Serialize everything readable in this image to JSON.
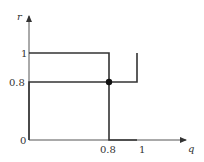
{
  "diagram": {
    "type": "best-response correspondence plot",
    "axes": {
      "x_label": "q",
      "y_label": "r",
      "x_ticks": [
        "0.8",
        "1"
      ],
      "y_ticks": [
        "1",
        "0.8"
      ],
      "origin_label": "0"
    },
    "curves": [
      {
        "name": "curve-1",
        "description": "r=1 for q<0.8, vertical at q=0.8 from 1 to 0, r=0 for q in 0.8..1",
        "points": [
          [
            0,
            1
          ],
          [
            0.8,
            1
          ],
          [
            0.8,
            0
          ],
          [
            1,
            0
          ]
        ]
      },
      {
        "name": "curve-2",
        "description": "q=0 for r<0.8, horizontal at r=0.8 from q=0 to 1, vertical at q=1 above 0.8",
        "points": [
          [
            0,
            0
          ],
          [
            0,
            0.8
          ],
          [
            1,
            0.8
          ],
          [
            1,
            1
          ]
        ]
      }
    ],
    "intersection": {
      "q": 0.8,
      "r": 0.8,
      "label": ""
    },
    "colors": {
      "line": "#333333",
      "axis": "#555555",
      "dot": "#111111"
    }
  }
}
